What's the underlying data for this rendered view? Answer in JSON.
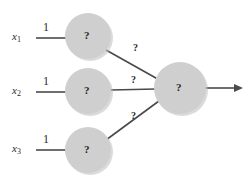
{
  "figure": {
    "type": "neural-network-diagram",
    "background_color": "#ffffff",
    "node_fill_color": "#cfcfcf",
    "edge_color": "#4a4a4a",
    "text_color": "#2b2b2b"
  },
  "inputs": [
    {
      "var_base": "x",
      "var_sub": "1",
      "weight_label": "1"
    },
    {
      "var_base": "x",
      "var_sub": "2",
      "weight_label": "1"
    },
    {
      "var_base": "x",
      "var_sub": "3",
      "weight_label": "1"
    }
  ],
  "hidden_nodes": [
    {
      "glyph": "?"
    },
    {
      "glyph": "?"
    },
    {
      "glyph": "?"
    }
  ],
  "hidden_to_output_edges": [
    {
      "glyph": "?"
    },
    {
      "glyph": "?"
    },
    {
      "glyph": "?"
    }
  ],
  "output_node": {
    "glyph": "?"
  }
}
